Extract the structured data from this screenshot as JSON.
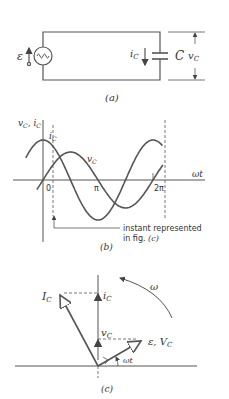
{
  "figure": {
    "panel_a": {
      "caption": "(a)",
      "source_label": "ε",
      "current_label": "i",
      "current_sub": "C",
      "capacitor_label": "C",
      "voltage_label": "v",
      "voltage_sub": "C"
    },
    "panel_b": {
      "caption": "(b)",
      "y_axis_label": "v",
      "y_axis_sub1": "C",
      "y_axis_sep": ", i",
      "y_axis_sub2": "C",
      "x_axis_label": "ωt",
      "ticks": [
        "0",
        "π",
        "2π"
      ],
      "curve_ic_label": "i",
      "curve_ic_sub": "C",
      "curve_vc_label": "v",
      "curve_vc_sub": "C",
      "annotation_line1": "instant represented",
      "annotation_line2": "in fig. ",
      "annotation_ref": "(c)"
    },
    "panel_c": {
      "caption": "(c)",
      "phasor_I_label": "I",
      "phasor_I_sub": "C",
      "proj_i_label": "i",
      "proj_i_sub": "C",
      "proj_v_label": "v",
      "proj_v_sub": "C",
      "phasor_V_label": "ε, V",
      "phasor_V_sub": "C",
      "angle_label": "ωt",
      "rotation_label": "ω"
    },
    "colors": {
      "line": "#555555",
      "text": "#333333",
      "background": "#ffffff"
    }
  }
}
